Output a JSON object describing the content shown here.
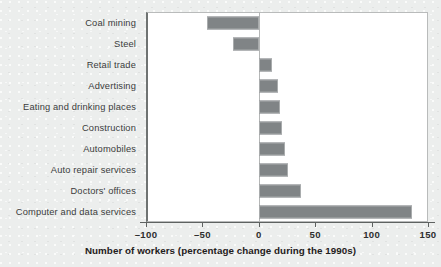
{
  "chart_data": {
    "type": "bar",
    "orientation": "horizontal",
    "title": "",
    "xlabel": "Number of workers (percentage change during the 1990s)",
    "ylabel": "",
    "xlim": [
      -100,
      150
    ],
    "xticks": [
      -100,
      -50,
      0,
      50,
      100,
      150
    ],
    "xtick_labels": [
      "–100",
      "–50",
      "0",
      "50",
      "100",
      "150"
    ],
    "grid": false,
    "legend": null,
    "zero_reference_line": 0,
    "bar_color": "#808486",
    "bar_border_color": "#a9acad",
    "plot_background": "#ffffff",
    "figure_background": "#eceeed",
    "categories": [
      "Coal mining",
      "Steel",
      "Retail trade",
      "Advertising",
      "Eating and drinking places",
      "Construction",
      "Automobiles",
      "Auto repair services",
      "Doctors' offices",
      "Computer and data services"
    ],
    "values": [
      -46,
      -23,
      12,
      17,
      19,
      21,
      23,
      26,
      37,
      136
    ]
  }
}
